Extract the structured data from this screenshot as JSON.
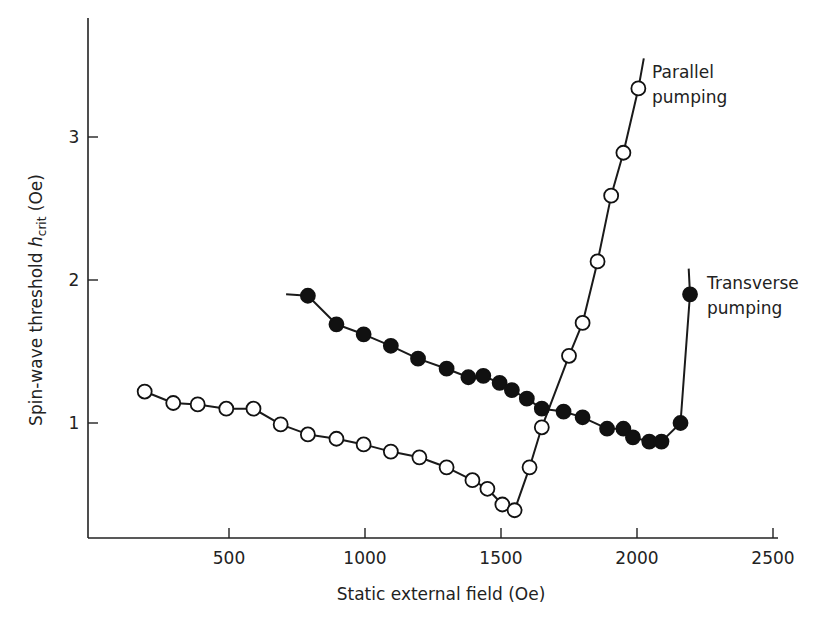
{
  "chart_data": {
    "type": "scatter",
    "title": "",
    "xlabel": "Static external field (Oe)",
    "ylabel": "Spin-wave threshold h_crit (Oe)",
    "ylabel_parts": {
      "pre": "Spin-wave threshold ",
      "sym": "h",
      "sub": "crit",
      "post": " (Oe)"
    },
    "xlim": [
      0,
      2500
    ],
    "ylim": [
      0.2,
      3.8
    ],
    "xticks": [
      500,
      1000,
      1500,
      2000,
      2500
    ],
    "yticks": [
      1,
      2,
      3
    ],
    "grid": false,
    "series": [
      {
        "name": "Parallel pumping",
        "marker": "open-circle",
        "label_lines": [
          "Parallel",
          "pumping"
        ],
        "x": [
          190,
          295,
          385,
          490,
          590,
          690,
          790,
          895,
          995,
          1095,
          1200,
          1300,
          1395,
          1450,
          1505,
          1550,
          1605,
          1650,
          1750,
          1800,
          1855,
          1905,
          1950,
          2005
        ],
        "y": [
          1.22,
          1.14,
          1.13,
          1.1,
          1.1,
          0.99,
          0.92,
          0.89,
          0.85,
          0.8,
          0.76,
          0.69,
          0.6,
          0.54,
          0.43,
          0.39,
          0.69,
          0.97,
          1.47,
          1.7,
          2.13,
          2.59,
          2.89,
          3.34
        ],
        "curve_end": [
          2025,
          3.55
        ]
      },
      {
        "name": "Transverse pumping",
        "marker": "filled-circle",
        "label_lines": [
          "Transverse",
          "pumping"
        ],
        "x": [
          790,
          895,
          995,
          1095,
          1195,
          1300,
          1380,
          1435,
          1495,
          1540,
          1595,
          1650,
          1730,
          1800,
          1890,
          1950,
          1985,
          2045,
          2090,
          2160,
          2195
        ],
        "y": [
          1.89,
          1.69,
          1.62,
          1.54,
          1.45,
          1.38,
          1.32,
          1.33,
          1.28,
          1.23,
          1.17,
          1.1,
          1.08,
          1.04,
          0.96,
          0.96,
          0.9,
          0.87,
          0.87,
          1.0,
          1.9
        ],
        "curve_start": [
          710,
          1.9
        ],
        "curve_end": [
          2190,
          2.08
        ]
      }
    ]
  }
}
